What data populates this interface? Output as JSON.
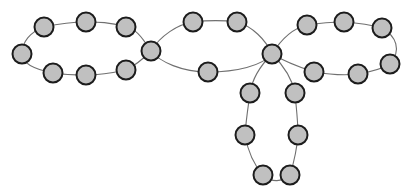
{
  "diagram": {
    "type": "graph",
    "style": {
      "node_fill": "#c0c0c0",
      "node_stroke": "#1c1c1c",
      "edge_color": "#707070",
      "node_radius": 9.5,
      "background": "#ffffff"
    },
    "hubs": [
      {
        "id": "h1",
        "x": 151,
        "y": 51
      },
      {
        "id": "h2",
        "x": 272,
        "y": 54
      }
    ],
    "cycles": [
      {
        "name": "left-loop",
        "path": "M151,51 C140,34 135,29 126,27 C108,22 100,22 86,22 C70,22 58,24 44,27 C30,32 22,42 22,54 C22,64 38,70 53,73 C66,75 75,75 86,75 C100,75 112,73 126,70 C138,64 145,57 151,51",
        "nodes": [
          {
            "x": 126,
            "y": 27
          },
          {
            "x": 86,
            "y": 22
          },
          {
            "x": 44,
            "y": 27
          },
          {
            "x": 22,
            "y": 54
          },
          {
            "x": 53,
            "y": 73
          },
          {
            "x": 86,
            "y": 75
          },
          {
            "x": 126,
            "y": 70
          }
        ]
      },
      {
        "name": "middle-loop",
        "path": "M151,51 C160,36 178,24 193,22 C210,20 222,20 237,22 C252,26 266,40 272,54 C262,66 236,72 208,72 C182,72 160,62 151,51",
        "nodes": [
          {
            "x": 193,
            "y": 22
          },
          {
            "x": 237,
            "y": 22
          },
          {
            "x": 208,
            "y": 72
          }
        ]
      },
      {
        "name": "right-loop",
        "path": "M272,54 C282,38 294,28 307,25 C320,23 332,22 344,22 C360,23 372,25 382,28 C396,36 402,50 390,64 C380,70 370,72 358,74 C342,76 326,74 314,72 C296,66 282,60 272,54",
        "nodes": [
          {
            "x": 307,
            "y": 25
          },
          {
            "x": 344,
            "y": 22
          },
          {
            "x": 382,
            "y": 28
          },
          {
            "x": 390,
            "y": 64
          },
          {
            "x": 358,
            "y": 74
          },
          {
            "x": 314,
            "y": 72
          }
        ]
      },
      {
        "name": "bottom-loop",
        "path": "M272,54 C260,66 252,80 250,93 C248,108 246,120 245,135 C248,152 254,165 263,175 C272,183 282,182 290,175 C294,162 297,148 298,135 C298,120 296,106 295,93 C292,78 282,64 272,54",
        "nodes": [
          {
            "x": 250,
            "y": 93
          },
          {
            "x": 245,
            "y": 135
          },
          {
            "x": 263,
            "y": 175
          },
          {
            "x": 290,
            "y": 175
          },
          {
            "x": 298,
            "y": 135
          },
          {
            "x": 295,
            "y": 93
          }
        ]
      }
    ],
    "node_count": 24
  }
}
